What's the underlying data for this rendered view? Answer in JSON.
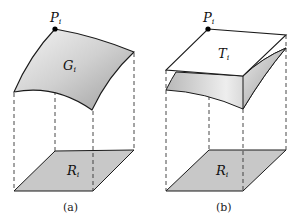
{
  "figure": {
    "panels": [
      {
        "id": "a",
        "caption": "(a)",
        "point_label": "P",
        "point_sub": "i",
        "surface_label": "G",
        "surface_sub": "i",
        "region_label": "R",
        "region_sub": "i"
      },
      {
        "id": "b",
        "caption": "(b)",
        "point_label": "P",
        "point_sub": "i",
        "surface_label": "T",
        "surface_sub": "i",
        "region_label": "R",
        "region_sub": "i"
      }
    ]
  },
  "colors": {
    "surface_light": "#f2f2f2",
    "surface_dark": "#a8a8a8",
    "region_fill": "#c8c8c8",
    "plane_fill": "#ffffff",
    "line": "#1a1a1a"
  }
}
